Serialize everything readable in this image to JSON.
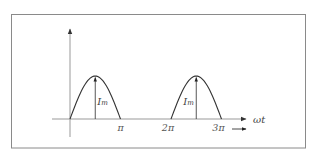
{
  "diagram": {
    "type": "half-wave rectified current waveform",
    "x_axis_label": "ωt",
    "x_ticks": [
      {
        "label": "π",
        "value": 1
      },
      {
        "label": "2π",
        "value": 2
      },
      {
        "label": "3π",
        "value": 3
      }
    ],
    "pulses": [
      {
        "start": 0,
        "end": 1,
        "amplitude_label_main": "I",
        "amplitude_label_sub": "m",
        "label_side": "right"
      },
      {
        "start": 2,
        "end": 3,
        "amplitude_label_main": "I",
        "amplitude_label_sub": "m",
        "label_side": "left"
      }
    ],
    "direction_arrow": "→",
    "colors": {
      "frame": "#8a8a8a",
      "axis": "#888888",
      "curve": "#333333",
      "text": "#444444"
    }
  }
}
